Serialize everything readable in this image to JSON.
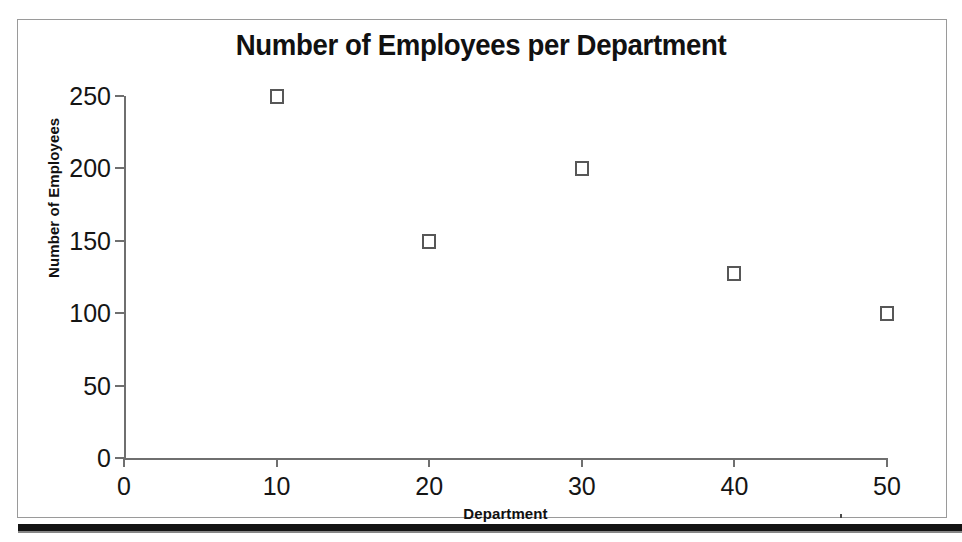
{
  "document": {
    "kind": "scanned-chart-page",
    "frame_color": "#9a9a9a",
    "rule_color": "#141414"
  },
  "chart_data": {
    "type": "scatter",
    "title": "Number of Employees per Department",
    "xlabel": "Department",
    "ylabel": "Number of Employees",
    "x": [
      10,
      20,
      30,
      40,
      50
    ],
    "values": [
      250,
      150,
      200,
      128,
      100
    ],
    "points": [
      {
        "x": 10,
        "y": 250
      },
      {
        "x": 20,
        "y": 150
      },
      {
        "x": 30,
        "y": 200
      },
      {
        "x": 40,
        "y": 128
      },
      {
        "x": 50,
        "y": 100
      }
    ],
    "xlim": [
      0,
      50
    ],
    "ylim": [
      0,
      250
    ],
    "xticks": [
      0,
      10,
      20,
      30,
      40,
      50
    ],
    "yticks": [
      0,
      50,
      100,
      150,
      200,
      250
    ],
    "xtick_labels": [
      "0",
      "10",
      "20",
      "30",
      "40",
      "50"
    ],
    "ytick_labels": [
      "0",
      "50",
      "100",
      "150",
      "200",
      "250"
    ],
    "grid": false,
    "legend": null,
    "marker": "open-square",
    "marker_color": "#575757",
    "axis_color": "#6f6f6f"
  }
}
